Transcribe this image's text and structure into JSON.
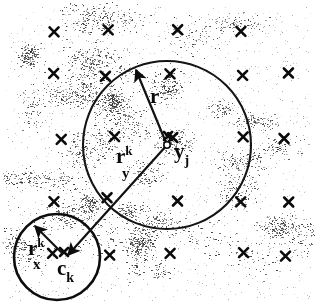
{
  "figure": {
    "background_color": "#ffffff",
    "ink_color": "#111111",
    "width": 316,
    "height": 306
  },
  "labels": {
    "query_radius": {
      "base": "r",
      "sup": "",
      "sub": ""
    },
    "node_to_center": {
      "base": "r",
      "sup": "k",
      "sub": "y"
    },
    "query_point": {
      "base": "y",
      "sup": "",
      "sub": "j"
    },
    "cluster_radius": {
      "base": "r",
      "sup": "k",
      "sub": "x"
    },
    "cluster_center": {
      "base": "c",
      "sup": "",
      "sub": "k"
    }
  },
  "circles": [
    {
      "name": "query-ball",
      "cx": 167,
      "cy": 145,
      "r": 84,
      "stroke": "#141414",
      "stroke_width": 2.1
    },
    {
      "name": "cluster-ball",
      "cx": 57,
      "cy": 257,
      "r": 43,
      "stroke": "#0d0d0d",
      "stroke_width": 2.6
    }
  ],
  "arrows": [
    {
      "name": "radius-arrow",
      "x1": 167,
      "x2": 136,
      "y1": 145,
      "y2": 70,
      "label": "r"
    },
    {
      "name": "center-distance-arrow",
      "x1": 167,
      "x2": 68,
      "y1": 145,
      "y2": 255,
      "label": "r^k_y"
    },
    {
      "name": "cluster-radius-arrow",
      "x1": 63,
      "x2": 35,
      "y1": 254,
      "y2": 226,
      "label": "r^k_x"
    }
  ],
  "center_markers": [
    {
      "name": "query-point-dot",
      "cx": 167,
      "cy": 145,
      "r": 3.2,
      "filled": false
    },
    {
      "name": "query-point-x",
      "cx": 168,
      "cy": 136,
      "size": 8
    },
    {
      "name": "cluster-center-x",
      "cx": 64,
      "cy": 252,
      "size": 8
    }
  ],
  "data_points": {
    "marker_glyph": "x",
    "description": "bold x markers arranged on a coarse grid over a background of scattered fine dot clusters",
    "grid": {
      "columns_x": [
        57,
        110,
        175,
        240,
        289
      ],
      "rows_y": [
        32,
        75,
        138,
        200,
        254
      ],
      "jitter_px": 5
    },
    "omitted_cells": [
      [
        0,
        4
      ]
    ],
    "marker_size": 9,
    "marker_color": "#0b0b0b"
  },
  "dot_cloud": {
    "description": "fine speckled dot texture, denser in irregular blobs",
    "dot_color": "#2c2c2c",
    "dot_count": 5200,
    "blob_count": 46,
    "dot_radius_px": 0.65
  }
}
